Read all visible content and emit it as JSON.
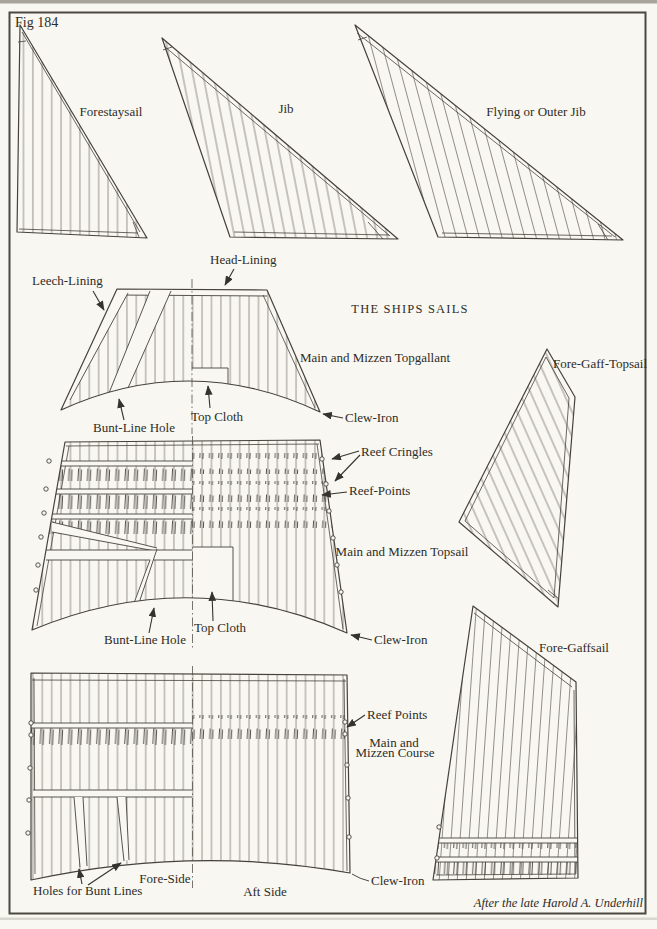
{
  "figure": {
    "number": "Fig 184",
    "title": "THE SHIPS SAILS",
    "credit": "After the late Harold A. Underhill"
  },
  "colors": {
    "paper": "#f8f7f2",
    "ink": "#45423b",
    "text": "#2e2c26"
  },
  "sails": {
    "forestaysail": "Forestaysail",
    "jib": "Jib",
    "flying_jib": "Flying or Outer Jib",
    "topgallant": "Main and Mizzen Topgallant",
    "fore_gaff_topsail": "Fore-Gaff-Topsail",
    "topsail": "Main and Mizzen Topsail",
    "fore_gaffsail": "Fore-Gaffsail",
    "course_line1": "Main and",
    "course_line2": "Mizzen Course"
  },
  "annotations": {
    "head_lining": "Head-Lining",
    "leech_lining": "Leech-Lining",
    "bunt_line_hole_topgallant": "Bunt-Line Hole",
    "top_cloth_topgallant": "Top Cloth",
    "clew_iron_topgallant": "Clew-Iron",
    "reef_cringles": "Reef Cringles",
    "reef_points_topsail": "Reef-Points",
    "bunt_line_hole_topsail": "Bunt-Line Hole",
    "top_cloth_topsail": "Top Cloth",
    "clew_iron_topsail": "Clew-Iron",
    "reef_points_course": "Reef Points",
    "holes_for_bunt_lines": "Holes for Bunt Lines",
    "fore_side": "Fore-Side",
    "aft_side": "Aft Side",
    "clew_iron_course": "Clew-Iron"
  }
}
